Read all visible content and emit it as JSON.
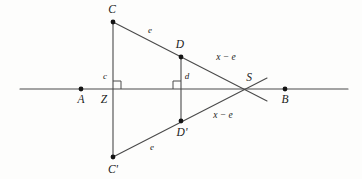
{
  "figure": {
    "kind": "geometry-diagram",
    "width": 362,
    "height": 179,
    "colors": {
      "background": "#fdfdfc",
      "stroke": "#4a4a4a",
      "point_fill": "#141414",
      "label": "#1a1a1a"
    },
    "baseline": {
      "name": "line-AB",
      "x1": 20,
      "y1": 89,
      "x2": 348,
      "y2": 89
    },
    "points": [
      {
        "id": "C",
        "label": "C",
        "x": 113,
        "y": 22,
        "label_x": 112,
        "label_y": 10,
        "radius": 2.4
      },
      {
        "id": "D",
        "label": "D",
        "x": 181,
        "y": 57,
        "label_x": 180,
        "label_y": 45,
        "radius": 2.4
      },
      {
        "id": "S",
        "label": "S",
        "x": 249,
        "y": 89,
        "label_x": 249,
        "label_y": 78,
        "radius": 0
      },
      {
        "id": "A",
        "label": "A",
        "x": 81,
        "y": 89,
        "label_x": 81,
        "label_y": 100,
        "radius": 2.4
      },
      {
        "id": "Z",
        "label": "Z",
        "x": 113,
        "y": 89,
        "label_x": 104,
        "label_y": 100,
        "radius": 0
      },
      {
        "id": "B",
        "label": "B",
        "x": 285,
        "y": 89,
        "label_x": 285,
        "label_y": 100,
        "radius": 2.4
      },
      {
        "id": "Dp",
        "label": "D'",
        "x": 181,
        "y": 121,
        "label_x": 182,
        "label_y": 133,
        "radius": 2.4
      },
      {
        "id": "Cp",
        "label": "C'",
        "x": 113,
        "y": 157,
        "label_x": 113,
        "label_y": 170,
        "radius": 2.4
      }
    ],
    "segments": [
      {
        "name": "segment-C-Cprime",
        "x1": 113,
        "y1": 22,
        "x2": 113,
        "y2": 157
      },
      {
        "name": "segment-D-Dprime",
        "x1": 181,
        "y1": 57,
        "x2": 181,
        "y2": 121
      },
      {
        "name": "ray-C-through-S",
        "x1": 113,
        "y1": 22,
        "x2": 267,
        "y2": 101
      },
      {
        "name": "ray-Cprime-through-S",
        "x1": 113,
        "y1": 157,
        "x2": 267,
        "y2": 78
      }
    ],
    "right_angles": [
      {
        "name": "right-angle-at-Z",
        "x": 113,
        "y": 89,
        "size": 8,
        "dir_x": 1,
        "dir_y": -1
      },
      {
        "name": "right-angle-at-D-foot",
        "x": 181,
        "y": 89,
        "size": 8,
        "dir_x": -1,
        "dir_y": -1
      }
    ],
    "segment_labels": [
      {
        "id": "e-upper",
        "text": "e",
        "x": 150,
        "y": 30
      },
      {
        "id": "xe-upper",
        "text": "x − e",
        "x": 226,
        "y": 58
      },
      {
        "id": "xe-lower",
        "text": "x − e",
        "x": 223,
        "y": 116
      },
      {
        "id": "e-lower",
        "text": "e",
        "x": 152,
        "y": 147
      },
      {
        "id": "c-height",
        "text": "c",
        "x": 105,
        "y": 76
      },
      {
        "id": "d-height",
        "text": "d",
        "x": 187,
        "y": 76
      }
    ]
  }
}
